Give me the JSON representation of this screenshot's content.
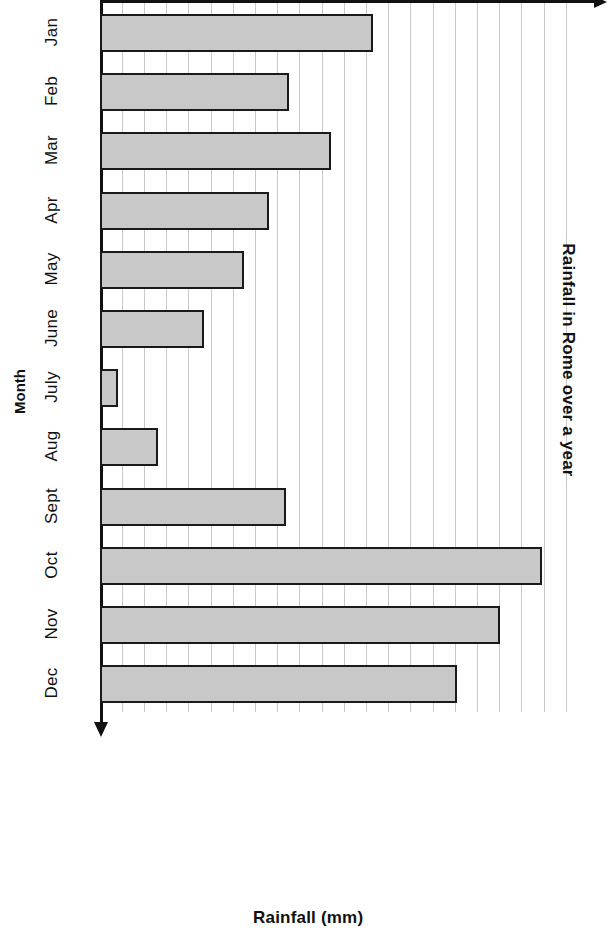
{
  "chart_data": {
    "type": "bar",
    "orientation": "horizontal",
    "title": "Rainfall in Rome over a year",
    "xlabel": "Rainfall (mm)",
    "ylabel": "Month",
    "categories": [
      "Jan",
      "Feb",
      "Mar",
      "Apr",
      "May",
      "June",
      "July",
      "Aug",
      "Sept",
      "Oct",
      "Nov",
      "Dec"
    ],
    "values": [
      12.3,
      8.5,
      10.4,
      7.6,
      6.5,
      4.7,
      0.8,
      2.6,
      8.4,
      19.9,
      18.0,
      16.1
    ],
    "unit": "gridlines",
    "xlim": [
      0,
      21
    ],
    "grid": true,
    "grid_axis": "x",
    "legend": null,
    "bar_fill": "#c8c8c8",
    "bar_stroke": "#1a1a1a",
    "gridline_color": "#c9c9c9",
    "axis_color": "#111111",
    "tick_labels": []
  },
  "labels": {
    "title": "Rainfall in Rome over a year",
    "month_axis": "Month",
    "rainfall_axis": "Rainfall (mm)",
    "months": [
      "Jan",
      "Feb",
      "Mar",
      "Apr",
      "May",
      "June",
      "July",
      "Aug",
      "Sept",
      "Oct",
      "Nov",
      "Dec"
    ]
  }
}
